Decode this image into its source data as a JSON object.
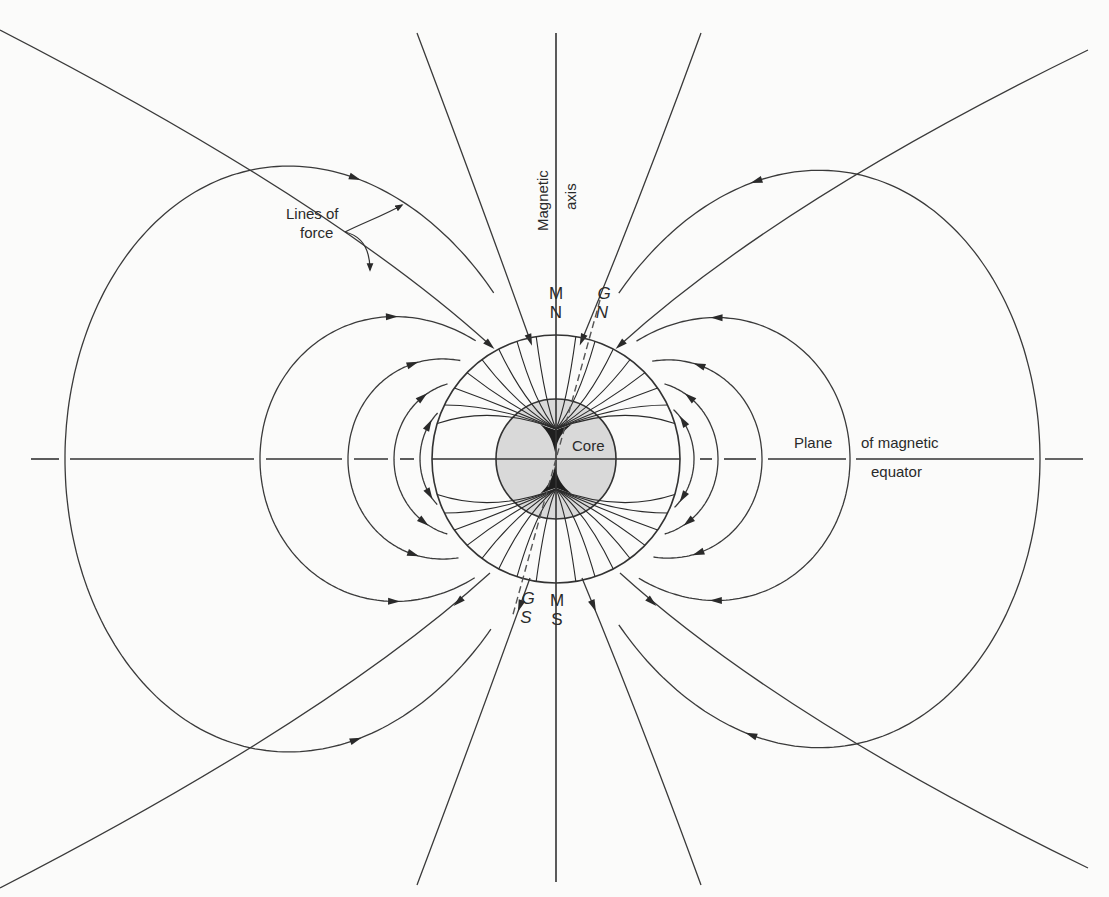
{
  "figure": {
    "type": "magnetic-dipole-field-diagram",
    "labels": {
      "magnetic_axis_line1": "Magnetic",
      "magnetic_axis_line2": "axis",
      "lines_of_force_line1": "Lines of",
      "lines_of_force_line2": "force",
      "core": "Core",
      "equator_part1": "Plane",
      "equator_part2": "of magnetic",
      "equator_part3": "equator",
      "magnetic_north_M": "M",
      "magnetic_north_N": "N",
      "geographic_north_G": "G",
      "geographic_north_N": "N",
      "geographic_south_G": "G",
      "geographic_south_S": "S",
      "magnetic_south_M": "M",
      "magnetic_south_S": "S"
    },
    "geometry": {
      "earth_center": [
        556,
        459
      ],
      "earth_radius": 124,
      "core_radius": 60,
      "axis_top_y": 33,
      "axis_bottom_y": 882,
      "equator_left_x": 31,
      "equator_right_x": 1083,
      "equator_crossings_left": [
        65,
        260,
        348,
        394,
        420,
        437
      ],
      "equator_crossings_right": [
        1040,
        850,
        762,
        718,
        694,
        680
      ]
    },
    "colors": {
      "background": "#fbfbfa",
      "line": "#3a3a3a",
      "earth_fill": "#ffffff",
      "core_fill": "#d9d9d9",
      "text": "#2a2a2a"
    }
  }
}
